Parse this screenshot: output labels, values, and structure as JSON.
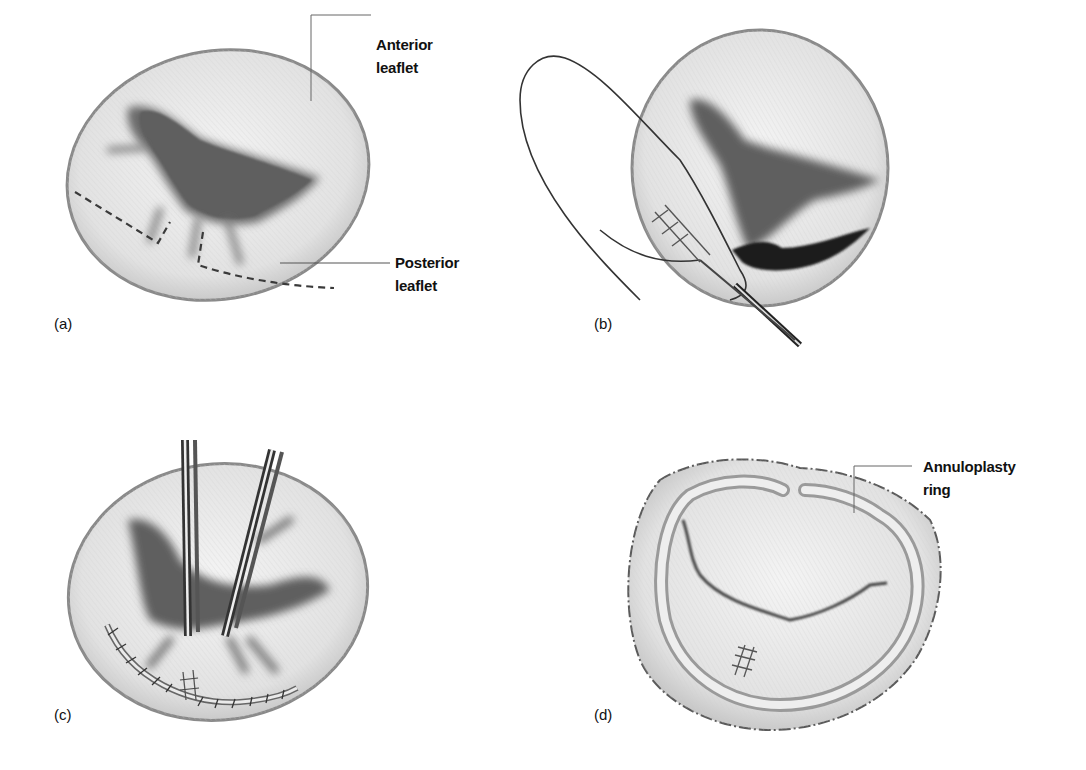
{
  "figure": {
    "panels": [
      {
        "id": "a",
        "label": "(a)",
        "annotations": [
          {
            "line1": "Anterior",
            "line2": "leaflet"
          },
          {
            "line1": "Posterior",
            "line2": "leaflet"
          }
        ]
      },
      {
        "id": "b",
        "label": "(b)",
        "annotations": []
      },
      {
        "id": "c",
        "label": "(c)",
        "annotations": []
      },
      {
        "id": "d",
        "label": "(d)",
        "annotations": [
          {
            "line1": "Annuloplasty",
            "line2": "ring"
          }
        ]
      }
    ]
  },
  "colors": {
    "background": "#ffffff",
    "valve_fill": "#e6e6e6",
    "valve_edge": "#8a8a8a",
    "orifice": "#555555",
    "dark_orifice": "#1e1e1e",
    "line": "#333333"
  }
}
